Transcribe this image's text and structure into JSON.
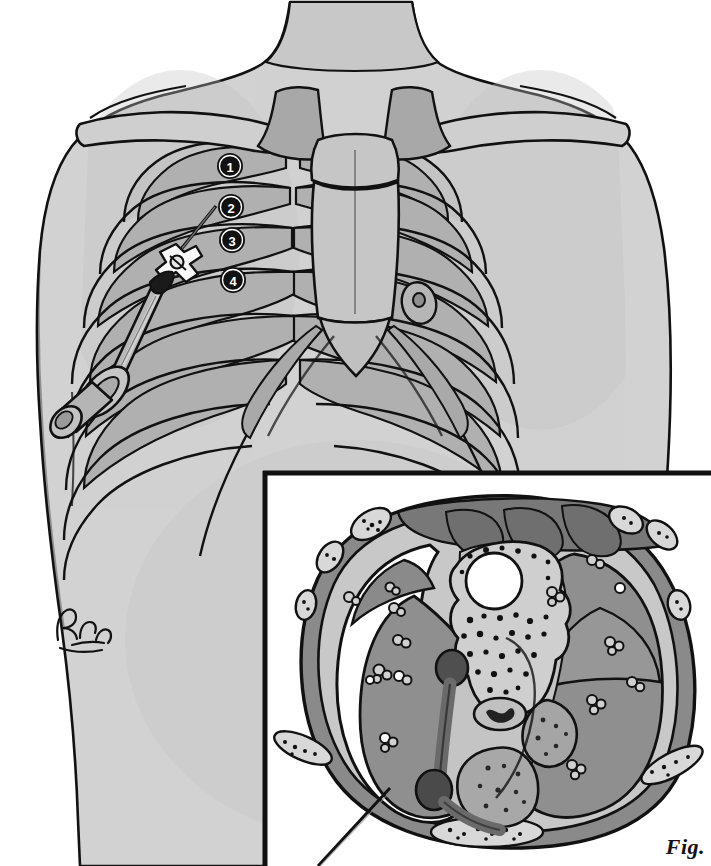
{
  "figure": {
    "domain": "medical-illustration",
    "title_label": "Fig.",
    "view": "Anterior chest wall with overlaid rib cage and inset axial thoracic cross-section",
    "artist_signature": "BMckee"
  },
  "colors": {
    "paper": "#ffffff",
    "skin": "#d2d2d2",
    "skin_shadow": "#c2c2c2",
    "bone_light": "#cfcfcf",
    "bone_mid": "#b5b5b5",
    "bone_dark": "#9d9d9d",
    "outline": "#111111",
    "marker_fill": "#111111",
    "marker_text": "#ffffff",
    "syringe_barrel": "#b8b8b8",
    "syringe_dark": "#6e6e6e",
    "lung_tissue": "#8f8f8f",
    "muscle": "#8a8a8a",
    "muscle_dark": "#787878",
    "mediastinum": "#c4c4c4",
    "vessel_dark": "#4f4f4f",
    "marrow": "#a5a5a5",
    "pneumothorax_air": "#ffffff"
  },
  "main_illustration": {
    "name": "anterior-chest-with-ribcage",
    "body_parts": [
      {
        "id": "neck",
        "label": "Neck"
      },
      {
        "id": "left-shoulder",
        "label": "Shoulder (patient right)"
      },
      {
        "id": "right-shoulder",
        "label": "Shoulder (patient left)"
      },
      {
        "id": "torso",
        "label": "Anterior thorax / chest wall"
      },
      {
        "id": "clavicle-left",
        "label": "Clavicle"
      },
      {
        "id": "clavicle-right",
        "label": "Clavicle"
      },
      {
        "id": "manubrium",
        "label": "Manubrium"
      },
      {
        "id": "sternum",
        "label": "Sternum body"
      },
      {
        "id": "xiphoid",
        "label": "Xiphoid process"
      },
      {
        "id": "ribcage",
        "label": "Rib cage"
      },
      {
        "id": "costal-margin",
        "label": "Costal margin"
      },
      {
        "id": "nipple",
        "label": "Nipple"
      }
    ],
    "intercostal_markers": [
      {
        "number": "1",
        "label": "1st intercostal space",
        "x": 230,
        "y": 166
      },
      {
        "number": "2",
        "label": "2nd intercostal space",
        "x": 231,
        "y": 207
      },
      {
        "number": "3",
        "label": "3rd intercostal space",
        "x": 232,
        "y": 240
      },
      {
        "number": "4",
        "label": "4th intercostal space",
        "x": 233,
        "y": 280
      }
    ],
    "device": {
      "name": "needle-and-syringe",
      "components": [
        {
          "id": "needle",
          "label": "Catheter-over-needle"
        },
        {
          "id": "stopcock",
          "label": "Three-way stopcock"
        },
        {
          "id": "barrel",
          "label": "Syringe barrel"
        },
        {
          "id": "flange",
          "label": "Finger flange"
        },
        {
          "id": "plunger",
          "label": "Plunger"
        }
      ],
      "insertion_note": "Needle entering 2nd intercostal space, midclavicular line"
    }
  },
  "inset": {
    "name": "axial-thoracic-cross-section",
    "frame": {
      "x": 262,
      "y": 470,
      "width": 449,
      "height": 396
    },
    "structures": [
      {
        "id": "chest-wall",
        "label": "Chest wall / skin and subcutaneous tissue"
      },
      {
        "id": "rib-sections",
        "label": "Rib cross-sections"
      },
      {
        "id": "intercostal-muscle",
        "label": "Intercostal muscles"
      },
      {
        "id": "paraspinal-muscle",
        "label": "Paraspinal muscles"
      },
      {
        "id": "pectoral-muscle",
        "label": "Pectoral muscle"
      },
      {
        "id": "vertebral-body",
        "label": "Vertebral body"
      },
      {
        "id": "spinal-canal",
        "label": "Spinal canal"
      },
      {
        "id": "spinous-process",
        "label": "Spinous process"
      },
      {
        "id": "right-lung",
        "label": "Collapsed lung"
      },
      {
        "id": "left-lung",
        "label": "Lung"
      },
      {
        "id": "lung-fissure",
        "label": "Interlobar fissure"
      },
      {
        "id": "pneumothorax",
        "label": "Pneumothorax (air in pleural space)"
      },
      {
        "id": "aorta",
        "label": "Descending aorta"
      },
      {
        "id": "esophagus",
        "label": "Esophagus"
      },
      {
        "id": "heart",
        "label": "Heart / mediastinum"
      },
      {
        "id": "pulmonary-vessels",
        "label": "Pulmonary vessels"
      },
      {
        "id": "sternum-section",
        "label": "Sternum cross-section"
      }
    ],
    "leader_line": {
      "label": "Pointer to pneumothorax",
      "from": {
        "x": 390,
        "y": 790
      },
      "to": {
        "x": 322,
        "y": 866
      }
    }
  }
}
